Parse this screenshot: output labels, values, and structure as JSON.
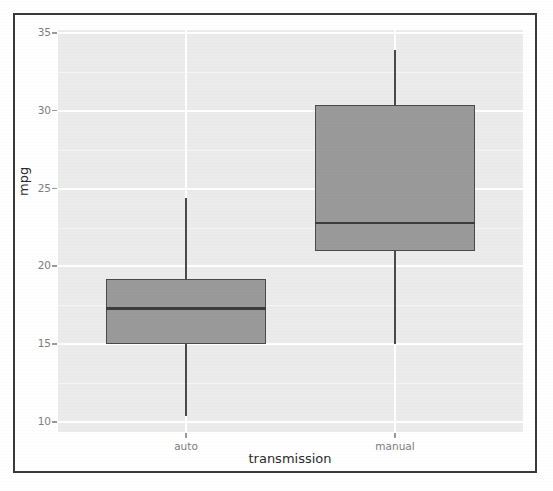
{
  "chart_data": {
    "type": "boxplot",
    "title": "",
    "xlabel": "transmission",
    "ylabel": "mpg",
    "categories": [
      "auto",
      "manual"
    ],
    "x_tick_labels": [
      "auto",
      "manual"
    ],
    "y_tick_labels": [
      "35",
      "30",
      "25",
      "20",
      "15",
      "10"
    ],
    "y_ticks": [
      35,
      30,
      25,
      20,
      15,
      10
    ],
    "ylim": [
      8.5,
      36.3
    ],
    "grid": "horizontal-and-vertical-white-on-grey",
    "legend": "none",
    "panel_background": "#ebebeb",
    "gridline_color": "#ffffff",
    "box_fill_color": "#9a9a9a",
    "box_border_color": "#4a4a4a",
    "boxes": [
      {
        "category": "auto",
        "whisker_low": 10.4,
        "q1": 15.0,
        "median": 17.3,
        "q3": 19.2,
        "whisker_high": 24.4,
        "outliers": []
      },
      {
        "category": "manual",
        "whisker_low": 15.0,
        "q1": 21.0,
        "median": 22.8,
        "q3": 30.4,
        "whisker_high": 33.9,
        "outliers": []
      }
    ]
  },
  "axes": {
    "y_title": "mpg",
    "x_title": "transmission",
    "y_labels": [
      {
        "value": 35,
        "text": "35"
      },
      {
        "value": 30,
        "text": "30"
      },
      {
        "value": 25,
        "text": "25"
      },
      {
        "value": 20,
        "text": "20"
      },
      {
        "value": 15,
        "text": "15"
      },
      {
        "value": 10,
        "text": "10"
      }
    ],
    "x_labels": [
      {
        "category": "auto",
        "text": "auto"
      },
      {
        "category": "manual",
        "text": "manual"
      }
    ]
  }
}
